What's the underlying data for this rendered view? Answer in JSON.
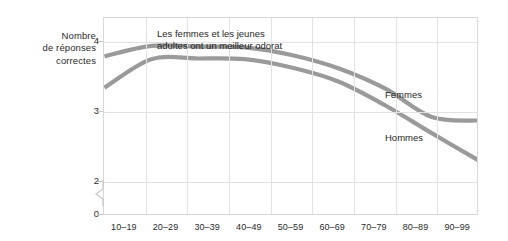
{
  "chart_data": {
    "type": "line",
    "title": "",
    "annotation": "Les femmes et les jeunes\nadultes ont un meilleur odorat",
    "ylabel": "Nombre de réponses correctes",
    "ylabel_lines": [
      "Nombre",
      "de réponses",
      "correctes"
    ],
    "xlabel": "",
    "categories": [
      "10–19",
      "20–29",
      "30–39",
      "40–49",
      "50–59",
      "60–69",
      "70–79",
      "80–89",
      "90–99"
    ],
    "ylim": [
      0,
      4.35
    ],
    "yticks": [
      "0",
      "2",
      "3",
      "4"
    ],
    "ytick_values": [
      0,
      2,
      3,
      4
    ],
    "axis_break": true,
    "axis_break_between": [
      0,
      2
    ],
    "grid": "both",
    "legend": "inline",
    "series": [
      {
        "name": "Femmes",
        "color": "#9a9a9a",
        "values": [
          3.8,
          3.95,
          3.94,
          3.93,
          3.82,
          3.63,
          3.34,
          2.93,
          2.88
        ]
      },
      {
        "name": "Hommes",
        "color": "#9a9a9a",
        "values": [
          3.35,
          3.76,
          3.77,
          3.76,
          3.64,
          3.44,
          3.1,
          2.7,
          2.31
        ]
      }
    ]
  },
  "series_labels": {
    "femmes": "Femmes",
    "hommes": "Hommes"
  }
}
